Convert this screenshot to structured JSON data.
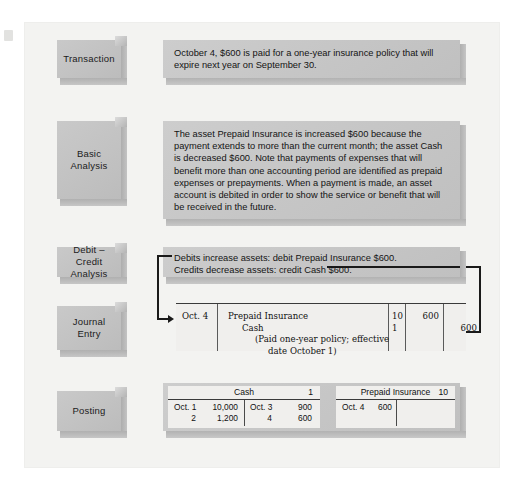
{
  "stages": [
    {
      "id": "transaction",
      "label": "Transaction"
    },
    {
      "id": "basic",
      "label": "Basic\nAnalysis"
    },
    {
      "id": "debit_credit",
      "label": "Debit – Credit\nAnalysis"
    },
    {
      "id": "journal",
      "label": "Journal\nEntry"
    },
    {
      "id": "posting",
      "label": "Posting"
    }
  ],
  "transaction": {
    "text": "October 4, $600 is paid for a one-year insurance policy that will expire next year on September 30."
  },
  "basic_analysis": {
    "text": "The asset Prepaid Insurance is increased $600 because the payment extends to more than the current month; the asset Cash is decreased $600. Note that payments of expenses that will benefit more than one accounting period are identified as prepaid expenses or prepayments. When a payment is made, an asset account is debited in order to show the service or benefit that will be received in the future."
  },
  "debit_credit_analysis": {
    "line1": "Debits increase assets: debit Prepaid Insurance $600.",
    "line2": "Credits decrease assets: credit Cash $600."
  },
  "journal_entry": {
    "date": "Oct. 4",
    "account_debit": "Prepaid Insurance",
    "account_credit": "Cash",
    "explanation_line1": "(Paid one-year policy; effective",
    "explanation_line2": "date October 1)",
    "ref_debit": "10",
    "ref_credit": "1",
    "debit_amount": "600",
    "credit_amount": "600"
  },
  "posting": {
    "accounts": [
      {
        "name": "Cash",
        "number": "1",
        "debit_rows": [
          {
            "date": "Oct. 1",
            "amount": "10,000"
          },
          {
            "date": "2",
            "amount": "1,200"
          }
        ],
        "credit_rows": [
          {
            "date": "Oct. 3",
            "amount": "900"
          },
          {
            "date": "4",
            "amount": "600"
          }
        ]
      },
      {
        "name": "Prepaid Insurance",
        "number": "10",
        "debit_rows": [
          {
            "date": "Oct. 4",
            "amount": "600"
          }
        ],
        "credit_rows": []
      }
    ]
  },
  "colors": {
    "page_background": "#ffffff",
    "panel_background": "#f3f3f1",
    "box_fill": "#c6c6c6",
    "box_shadow": "#b0b0b0",
    "table_fill": "#f0efed",
    "rule": "#3a3a3a",
    "connector": "#1a1a1a",
    "text": "#141414"
  }
}
